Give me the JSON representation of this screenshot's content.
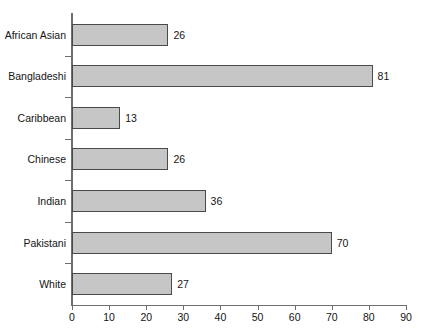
{
  "chart_data": {
    "type": "bar",
    "orientation": "horizontal",
    "title": "",
    "subtitle": "",
    "xlabel": "",
    "ylabel": "",
    "categories": [
      "African Asian",
      "Bangladeshi",
      "Caribbean",
      "Chinese",
      "Indian",
      "Pakistani",
      "White"
    ],
    "values": [
      26,
      81,
      13,
      26,
      36,
      70,
      27
    ],
    "data_labels": [
      "26",
      "81",
      "13",
      "26",
      "36",
      "70",
      "27"
    ],
    "xlim": [
      0,
      90
    ],
    "xticks": [
      0,
      10,
      20,
      30,
      40,
      50,
      60,
      70,
      80,
      90
    ],
    "xtick_labels": [
      "0",
      "10",
      "20",
      "30",
      "40",
      "50",
      "60",
      "70",
      "80",
      "90"
    ],
    "grid": false,
    "legend": null,
    "legend_position": "none",
    "colors": {
      "bar_fill": "#c6c6c6",
      "bar_border": "#4a4a4a",
      "axis": "#6e6e6e",
      "text": "#141414",
      "background": "#ffffff"
    }
  }
}
